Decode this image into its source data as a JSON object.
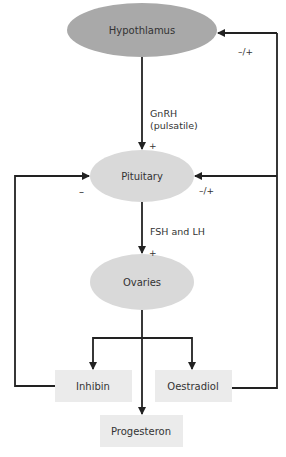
{
  "nodes": {
    "hypothalamus": {
      "label": "Hypothlamus",
      "fill": "#a9a9a9"
    },
    "pituitary": {
      "label": "Pituitary",
      "fill": "#d9d9d9"
    },
    "ovaries": {
      "label": "Ovaries",
      "fill": "#d9d9d9"
    },
    "inhibin": {
      "label": "Inhibin",
      "fill": "#ebebeb"
    },
    "oestradiol": {
      "label": "Oestradiol",
      "fill": "#ebebeb"
    },
    "progesteron": {
      "label": "Progesteron",
      "fill": "#ebebeb"
    }
  },
  "edges": {
    "gnrh_line1": "GnRH",
    "gnrh_line2": "(pulsatile)",
    "gnrh_sign": "+",
    "fsh_lh": "FSH and LH",
    "fsh_lh_sign": "+",
    "inhibin_sign": "–",
    "oestradiol_pituitary_sign": "–/+",
    "oestradiol_hypothalamus_sign": "–/+"
  },
  "colors": {
    "line": "#222222",
    "text": "#333333"
  }
}
